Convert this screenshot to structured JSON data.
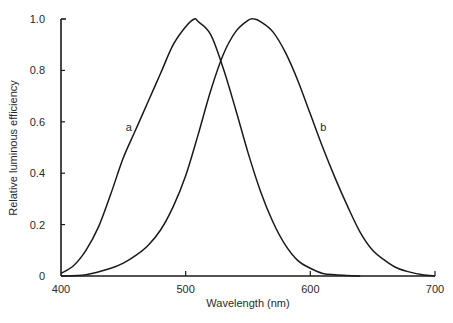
{
  "chart_data": {
    "type": "line",
    "title": "",
    "xlabel": "Wavelength (nm)",
    "ylabel": "Relative luminous efficiency",
    "xlim": [
      400,
      700
    ],
    "ylim": [
      0,
      1.0
    ],
    "grid": false,
    "legend": "inline labels",
    "x_ticks": [
      400,
      500,
      600,
      700
    ],
    "x_tick_labels": [
      "400",
      "500",
      "600",
      "700"
    ],
    "y_ticks": [
      0,
      0.2,
      0.4,
      0.6,
      0.8,
      1.0
    ],
    "y_tick_labels": [
      "0",
      "0.2",
      "0.4",
      "0.6",
      "0.8",
      "1.0"
    ],
    "series": [
      {
        "name": "a",
        "label_position": {
          "x": 452,
          "y": 0.58
        },
        "x": [
          400,
          410,
          420,
          430,
          440,
          450,
          460,
          470,
          480,
          490,
          500,
          507,
          510,
          520,
          530,
          540,
          550,
          560,
          570,
          580,
          590,
          600,
          610,
          620,
          630,
          640
        ],
        "values": [
          0.01,
          0.04,
          0.1,
          0.19,
          0.32,
          0.46,
          0.57,
          0.68,
          0.79,
          0.9,
          0.97,
          1.0,
          0.99,
          0.94,
          0.81,
          0.65,
          0.48,
          0.33,
          0.21,
          0.12,
          0.06,
          0.03,
          0.01,
          0.005,
          0.002,
          0.0
        ]
      },
      {
        "name": "b",
        "label_position": {
          "x": 608,
          "y": 0.58
        },
        "x": [
          400,
          420,
          440,
          450,
          460,
          470,
          480,
          490,
          500,
          510,
          520,
          530,
          540,
          550,
          555,
          560,
          570,
          580,
          590,
          600,
          610,
          620,
          630,
          640,
          650,
          660,
          670,
          680,
          690,
          700
        ],
        "values": [
          0.0,
          0.005,
          0.03,
          0.05,
          0.08,
          0.12,
          0.18,
          0.27,
          0.39,
          0.55,
          0.72,
          0.86,
          0.95,
          0.995,
          1.0,
          0.99,
          0.95,
          0.87,
          0.76,
          0.63,
          0.5,
          0.38,
          0.27,
          0.17,
          0.1,
          0.06,
          0.03,
          0.015,
          0.005,
          0.0
        ]
      }
    ],
    "annotations": [
      "a",
      "b"
    ]
  },
  "labels": {
    "curve_a": "a",
    "curve_b": "b",
    "xlabel": "Wavelength (nm)",
    "ylabel": "Relative luminous efficiency"
  },
  "style": {
    "line_color": "#1a1a1a",
    "text_color": "#2a2a2a",
    "background": "#ffffff"
  }
}
